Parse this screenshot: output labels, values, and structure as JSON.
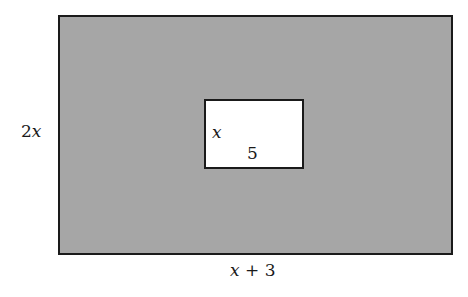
{
  "figure": {
    "type": "nested-rectangles",
    "outer_rectangle": {
      "fill_color": "#a6a6a6",
      "border_color": "#1a1a1a",
      "height_label": {
        "coef": "2",
        "var": "x"
      },
      "width_label": {
        "var": "x",
        "rest": " + 3"
      }
    },
    "inner_rectangle": {
      "fill_color": "#ffffff",
      "border_color": "#1a1a1a",
      "height_label": {
        "var": "x"
      },
      "width_label": "5"
    }
  }
}
